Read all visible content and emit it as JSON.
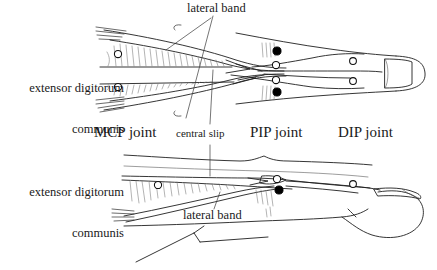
{
  "figure": {
    "views": [
      "dorsal-view",
      "lateral-view"
    ],
    "style": {
      "background": "#ffffff",
      "ink": "#1a1a1a",
      "hatch": "#6e6e6e",
      "marker_open": "#ffffff",
      "marker_filled": "#000000"
    }
  },
  "labels": {
    "edc_top_line1": "extensor digitorum",
    "edc_top_line2": "communis",
    "edc_bottom_line1": "extensor digitorum",
    "edc_bottom_line2": "communis",
    "lateral_band_top": "lateral band",
    "lateral_band_bottom": "lateral band",
    "mcp_joint": "MCP joint",
    "central_slip": "central slip",
    "pip_joint": "PIP joint",
    "dip_joint": "DIP joint"
  },
  "markers": {
    "dorsal": [
      {
        "name": "mcp-upper-open",
        "type": "open",
        "x": 118,
        "y": 54
      },
      {
        "name": "mcp-lower-open",
        "type": "open",
        "x": 118,
        "y": 87
      },
      {
        "name": "pip-upper-filled",
        "type": "filled",
        "x": 277,
        "y": 51
      },
      {
        "name": "pip-upper-open",
        "type": "open",
        "x": 276,
        "y": 65
      },
      {
        "name": "pip-lower-open",
        "type": "open",
        "x": 276,
        "y": 80
      },
      {
        "name": "pip-lower-filled",
        "type": "filled",
        "x": 277,
        "y": 92
      },
      {
        "name": "dip-upper-open",
        "type": "open",
        "x": 353,
        "y": 61
      },
      {
        "name": "dip-lower-open",
        "type": "open",
        "x": 353,
        "y": 81
      }
    ],
    "lateral": [
      {
        "name": "mcp-open",
        "type": "open",
        "x": 158,
        "y": 185
      },
      {
        "name": "pip-open",
        "type": "open",
        "x": 277,
        "y": 179
      },
      {
        "name": "pip-filled",
        "type": "filled",
        "x": 279,
        "y": 190
      },
      {
        "name": "dip-open",
        "type": "open",
        "x": 353,
        "y": 184
      }
    ]
  }
}
